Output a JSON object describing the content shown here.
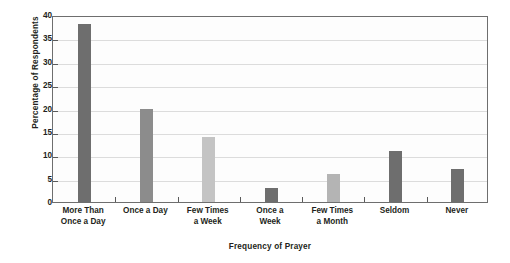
{
  "chart_data": {
    "type": "bar",
    "title": "",
    "subtitle": "",
    "xlabel": "Frequency of Prayer",
    "ylabel": "Percentage of Respondents",
    "categories": [
      "More Than\nOnce a Day",
      "Once a Day",
      "Few Times\na Week",
      "Once a\nWeek",
      "Few Times\na Month",
      "Seldom",
      "Never"
    ],
    "category_lines": [
      [
        "More Than",
        "Once a Day"
      ],
      [
        "Once a Day"
      ],
      [
        "Few Times",
        "a Week"
      ],
      [
        "Once a",
        "Week"
      ],
      [
        "Few Times",
        "a Month"
      ],
      [
        "Seldom"
      ],
      [
        "Never"
      ]
    ],
    "values": [
      38,
      20,
      14,
      3,
      6,
      11,
      7
    ],
    "bar_colors": [
      "#6e6e6e",
      "#8c8c8c",
      "#c4c4c4",
      "#6e6e6e",
      "#b4b4b4",
      "#6e6e6e",
      "#6e6e6e"
    ],
    "ylim": [
      0,
      40
    ],
    "ytick_labels": [
      "0",
      "5",
      "10",
      "15",
      "20",
      "25",
      "30",
      "35",
      "40"
    ],
    "ytick_values": [
      0,
      5,
      10,
      15,
      20,
      25,
      30,
      35,
      40
    ],
    "grid": true,
    "grid_axis": "y",
    "grid_color": "#dcdcdc",
    "legend": false,
    "legend_position": "none",
    "frame_color": "#6e6e6e",
    "background_color": "#fdfdfd",
    "text_color": "#231f20"
  }
}
